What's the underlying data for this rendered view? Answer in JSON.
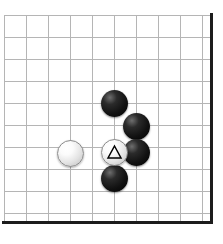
{
  "board": {
    "name": "go-board-diagram",
    "kind": "go",
    "background_color": "#ffffff",
    "grid_line_color": "#b5b5b5",
    "edge_color": "#1c1c1c",
    "width_px": 223,
    "height_px": 244,
    "cell_size_px": 22,
    "stone_diameter_px": 27,
    "grid": {
      "origin_x_px": 4,
      "origin_y_px": 15,
      "columns": 10,
      "rows": 10,
      "column_x_px": [
        4,
        26,
        48,
        70,
        92,
        114,
        136,
        158,
        180,
        202
      ],
      "row_y_px": [
        15,
        37,
        59,
        81,
        103,
        125,
        147,
        169,
        191,
        213
      ]
    },
    "edges": [
      {
        "name": "board-edge-right",
        "side": "right",
        "x_px": 210,
        "thickness_px": 3
      },
      {
        "name": "board-edge-bottom",
        "side": "bottom",
        "y_px": 221,
        "thickness_px": 3
      }
    ]
  },
  "stones": [
    {
      "name": "black-stone-1",
      "color": "black",
      "cx_px": 114,
      "cy_px": 103,
      "marker": "none",
      "label": ""
    },
    {
      "name": "black-stone-2",
      "color": "black",
      "cx_px": 136,
      "cy_px": 126,
      "marker": "none",
      "label": ""
    },
    {
      "name": "black-stone-3",
      "color": "black",
      "cx_px": 136,
      "cy_px": 152,
      "marker": "none",
      "label": ""
    },
    {
      "name": "black-stone-4",
      "color": "black",
      "cx_px": 114,
      "cy_px": 178,
      "marker": "none",
      "label": ""
    },
    {
      "name": "white-stone-marked",
      "color": "white",
      "cx_px": 114,
      "cy_px": 152,
      "marker": "triangle",
      "label": ""
    },
    {
      "name": "white-stone-left",
      "color": "white",
      "cx_px": 70,
      "cy_px": 153,
      "marker": "none",
      "label": ""
    }
  ],
  "markers": {
    "triangle": {
      "name": "triangle-marker",
      "shape": "triangle-up-outline",
      "stroke_color": "#000000",
      "fill_color": "none",
      "stroke_width_px": 1.6
    }
  }
}
